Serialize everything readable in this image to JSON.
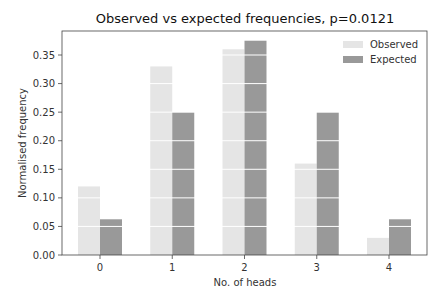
{
  "chart_data": {
    "type": "bar",
    "title": "Observed vs expected frequencies, p=0.0121",
    "xlabel": "No. of heads",
    "ylabel": "Normalised frequency",
    "categories": [
      "0",
      "1",
      "2",
      "3",
      "4"
    ],
    "series": [
      {
        "name": "Observed",
        "color": "#e5e5e5",
        "values": [
          0.12,
          0.33,
          0.36,
          0.16,
          0.03
        ]
      },
      {
        "name": "Expected",
        "color": "#999999",
        "values": [
          0.0625,
          0.25,
          0.375,
          0.25,
          0.0625
        ]
      }
    ],
    "yticks": [
      "0.00",
      "0.05",
      "0.10",
      "0.15",
      "0.20",
      "0.25",
      "0.30",
      "0.35"
    ],
    "ylim": [
      0,
      0.392
    ],
    "grid": "white horizontal lines over bars",
    "legend_position": "upper right"
  }
}
